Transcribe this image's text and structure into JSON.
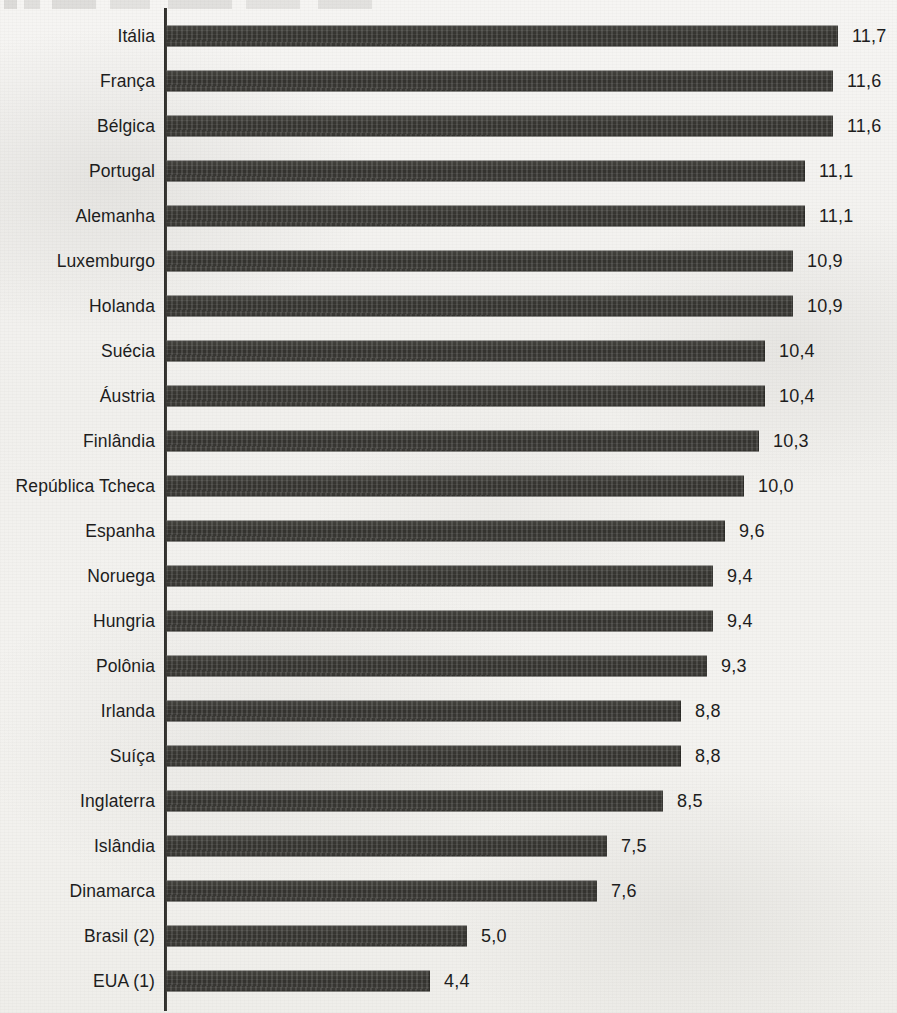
{
  "chart_data": {
    "type": "bar",
    "orientation": "horizontal",
    "title": "",
    "xlabel": "",
    "ylabel": "",
    "grid": false,
    "legend": null,
    "xlim": [
      0,
      12
    ],
    "axis_origin_value": 0,
    "value_decimal_separator": ",",
    "categories": [
      "Itália",
      "França",
      "Bélgica",
      "Portugal",
      "Alemanha",
      "Luxemburgo",
      "Holanda",
      "Suécia",
      "Áustria",
      "Finlândia",
      "República Tcheca",
      "Espanha",
      "Noruega",
      "Hungria",
      "Polônia",
      "Irlanda",
      "Suíça",
      "Inglaterra",
      "Islândia",
      "Dinamarca",
      "Brasil (2)",
      "EUA (1)"
    ],
    "values": [
      11.7,
      11.6,
      11.6,
      11.1,
      11.1,
      10.9,
      10.9,
      10.4,
      10.4,
      10.3,
      10.0,
      9.6,
      9.4,
      9.4,
      9.3,
      8.8,
      8.8,
      8.5,
      7.5,
      7.6,
      5.0,
      4.4
    ],
    "value_labels": [
      "11,7",
      "11,6",
      "11,6",
      "11,1",
      "11,1",
      "10,9",
      "10,9",
      "10,4",
      "10,4",
      "10,3",
      "10,0",
      "9,6",
      "9,4",
      "9,4",
      "9,3",
      "8,8",
      "8,8",
      "8,5",
      "7,5",
      "7,6",
      "5,0",
      "4,4"
    ],
    "bar_pixel_lengths": [
      672,
      667,
      667,
      639,
      639,
      627,
      627,
      599,
      599,
      593,
      578,
      559,
      547,
      547,
      541,
      515,
      515,
      497,
      441,
      431,
      301,
      264
    ]
  },
  "colors": {
    "bar": "#3a3933",
    "paper": "#f4f3f1",
    "text": "#1d1d1d",
    "axis": "#2c2b28"
  }
}
